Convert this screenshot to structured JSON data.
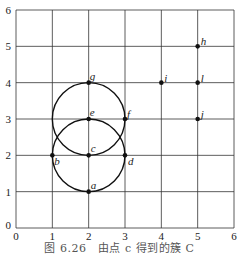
{
  "figure": {
    "caption": "图 6.26　由点 c 得到的簇 C",
    "grid": {
      "x_ticks": [
        "0",
        "1",
        "2",
        "3",
        "4",
        "5",
        "6"
      ],
      "y_ticks": [
        "0",
        "1",
        "2",
        "3",
        "4",
        "5",
        "6"
      ],
      "xlim": [
        0,
        6
      ],
      "ylim": [
        0,
        6
      ]
    },
    "points": [
      {
        "label": "a",
        "x": 2,
        "y": 1
      },
      {
        "label": "b",
        "x": 1,
        "y": 2
      },
      {
        "label": "c",
        "x": 2,
        "y": 2
      },
      {
        "label": "d",
        "x": 3,
        "y": 2
      },
      {
        "label": "e",
        "x": 2,
        "y": 3
      },
      {
        "label": "f",
        "x": 3,
        "y": 3
      },
      {
        "label": "g",
        "x": 2,
        "y": 4
      },
      {
        "label": "h",
        "x": 5,
        "y": 5
      },
      {
        "label": "i",
        "x": 4,
        "y": 4
      },
      {
        "label": "j",
        "x": 5,
        "y": 3
      },
      {
        "label": "l",
        "x": 5,
        "y": 4
      }
    ],
    "circles": [
      {
        "center": "c",
        "cx": 2,
        "cy": 2,
        "r": 1
      },
      {
        "center": "e",
        "cx": 2,
        "cy": 3,
        "r": 1
      }
    ],
    "colors": {
      "grid": "#333333",
      "stroke": "#111111",
      "text": "#222222"
    }
  }
}
